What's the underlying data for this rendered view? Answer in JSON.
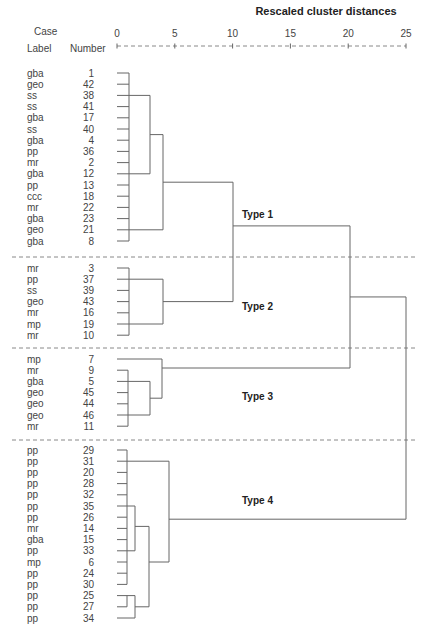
{
  "chart_data": {
    "type": "dendrogram",
    "title": "Rescaled cluster distances",
    "header": {
      "case": "Case",
      "label": "Label",
      "number": "Number"
    },
    "axis": {
      "ticks": [
        0,
        5,
        10,
        15,
        20,
        25
      ],
      "range": [
        0,
        25
      ]
    },
    "groups": [
      {
        "name": "Type 1",
        "cases": [
          {
            "label": "gba",
            "number": 1
          },
          {
            "label": "geo",
            "number": 42
          },
          {
            "label": "ss",
            "number": 38
          },
          {
            "label": "ss",
            "number": 41
          },
          {
            "label": "gba",
            "number": 17
          },
          {
            "label": "ss",
            "number": 40
          },
          {
            "label": "gba",
            "number": 4
          },
          {
            "label": "pp",
            "number": 36
          },
          {
            "label": "mr",
            "number": 2
          },
          {
            "label": "gba",
            "number": 12
          },
          {
            "label": "pp",
            "number": 13
          },
          {
            "label": "ccc",
            "number": 18
          },
          {
            "label": "mr",
            "number": 22
          },
          {
            "label": "gba",
            "number": 23
          },
          {
            "label": "geo",
            "number": 21
          },
          {
            "label": "gba",
            "number": 8
          }
        ]
      },
      {
        "name": "Type 2",
        "cases": [
          {
            "label": "mr",
            "number": 3
          },
          {
            "label": "pp",
            "number": 37
          },
          {
            "label": "ss",
            "number": 39
          },
          {
            "label": "geo",
            "number": 43
          },
          {
            "label": "mr",
            "number": 16
          },
          {
            "label": "mp",
            "number": 19
          },
          {
            "label": "mr",
            "number": 10
          }
        ]
      },
      {
        "name": "Type 3",
        "cases": [
          {
            "label": "mp",
            "number": 7
          },
          {
            "label": "mr",
            "number": 9
          },
          {
            "label": "gba",
            "number": 5
          },
          {
            "label": "geo",
            "number": 45
          },
          {
            "label": "geo",
            "number": 44
          },
          {
            "label": "geo",
            "number": 46
          },
          {
            "label": "mr",
            "number": 11
          }
        ]
      },
      {
        "name": "Type 4",
        "cases": [
          {
            "label": "pp",
            "number": 29
          },
          {
            "label": "pp",
            "number": 31
          },
          {
            "label": "pp",
            "number": 20
          },
          {
            "label": "pp",
            "number": 28
          },
          {
            "label": "pp",
            "number": 32
          },
          {
            "label": "pp",
            "number": 35
          },
          {
            "label": "pp",
            "number": 26
          },
          {
            "label": "mr",
            "number": 14
          },
          {
            "label": "gba",
            "number": 15
          },
          {
            "label": "pp",
            "number": 33
          },
          {
            "label": "mp",
            "number": 6
          },
          {
            "label": "pp",
            "number": 24
          },
          {
            "label": "pp",
            "number": 30
          },
          {
            "label": "pp",
            "number": 25
          },
          {
            "label": "pp",
            "number": 27
          },
          {
            "label": "pp",
            "number": 34
          }
        ]
      }
    ],
    "merges_approx": [
      {
        "clusters": "Type 1 core",
        "distance": 1
      },
      {
        "clusters": "Type 1 sub (38..12)",
        "distance": 3
      },
      {
        "clusters": "Type 1 + 21..8",
        "distance": 4
      },
      {
        "clusters": "Type 2 core",
        "distance": 4
      },
      {
        "clusters": "Type 1 + Type 2",
        "distance": 10
      },
      {
        "clusters": "Type 3 core",
        "distance": 4
      },
      {
        "clusters": "(Type 1+2) + Type 3",
        "distance": 20
      },
      {
        "clusters": "Type 4 core",
        "distance": 4.5
      },
      {
        "clusters": "All",
        "distance": 25
      }
    ]
  }
}
